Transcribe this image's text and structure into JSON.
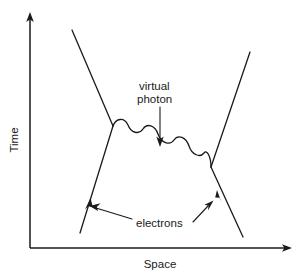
{
  "figure": {
    "kind": "feynman-diagram",
    "background_color": "#ffffff",
    "ink_color": "#1a1a1a"
  },
  "axes": {
    "y": {
      "label": "Time",
      "orientation": "vertical",
      "arrow": "up",
      "origin": {
        "x": 30,
        "y": 248
      },
      "tip": {
        "x": 30,
        "y": 16
      }
    },
    "x": {
      "label": "Space",
      "orientation": "horizontal",
      "arrow": "right",
      "origin": {
        "x": 30,
        "y": 248
      },
      "tip": {
        "x": 292,
        "y": 248
      }
    }
  },
  "annotations": [
    {
      "id": "virtual-photon",
      "line1": "virtual",
      "line2": "photon",
      "text": "virtual photon",
      "text_x": 139,
      "text_y": 90,
      "pointer_from": {
        "x": 160,
        "y": 105
      },
      "pointer_to": {
        "x": 160,
        "y": 146
      }
    },
    {
      "id": "electrons",
      "text": "electrons",
      "text_x": 136,
      "text_y": 223,
      "pointer_left_from": {
        "x": 132,
        "y": 218
      },
      "pointer_left_to": {
        "x": 91,
        "y": 206
      },
      "pointer_right_from": {
        "x": 192,
        "y": 220
      },
      "pointer_right_to": {
        "x": 212,
        "y": 202
      }
    }
  ],
  "particle_lines": {
    "incoming_left": {
      "start": {
        "x": 72,
        "y": 30
      },
      "end": {
        "x": 113,
        "y": 126
      },
      "type": "fermion"
    },
    "outgoing_left_down": {
      "start": {
        "x": 113,
        "y": 126
      },
      "end": {
        "x": 80,
        "y": 233
      },
      "type": "fermion",
      "arrow_at": {
        "x": 89,
        "y": 204
      },
      "arrow_dir": "up-right"
    },
    "incoming_right": {
      "start": {
        "x": 211,
        "y": 167
      },
      "end": {
        "x": 250,
        "y": 52
      },
      "type": "fermion"
    },
    "outgoing_right_down": {
      "start": {
        "x": 211,
        "y": 167
      },
      "end": {
        "x": 243,
        "y": 237
      },
      "type": "fermion",
      "arrow_at": {
        "x": 219,
        "y": 196
      },
      "arrow_dir": "up-left"
    },
    "photon": {
      "start": {
        "x": 113,
        "y": 126
      },
      "end": {
        "x": 211,
        "y": 167
      },
      "type": "wavy",
      "oscillations": 5
    }
  },
  "vertices": [
    {
      "id": "left-vertex",
      "x": 113,
      "y": 126
    },
    {
      "id": "right-vertex",
      "x": 211,
      "y": 167
    }
  ]
}
